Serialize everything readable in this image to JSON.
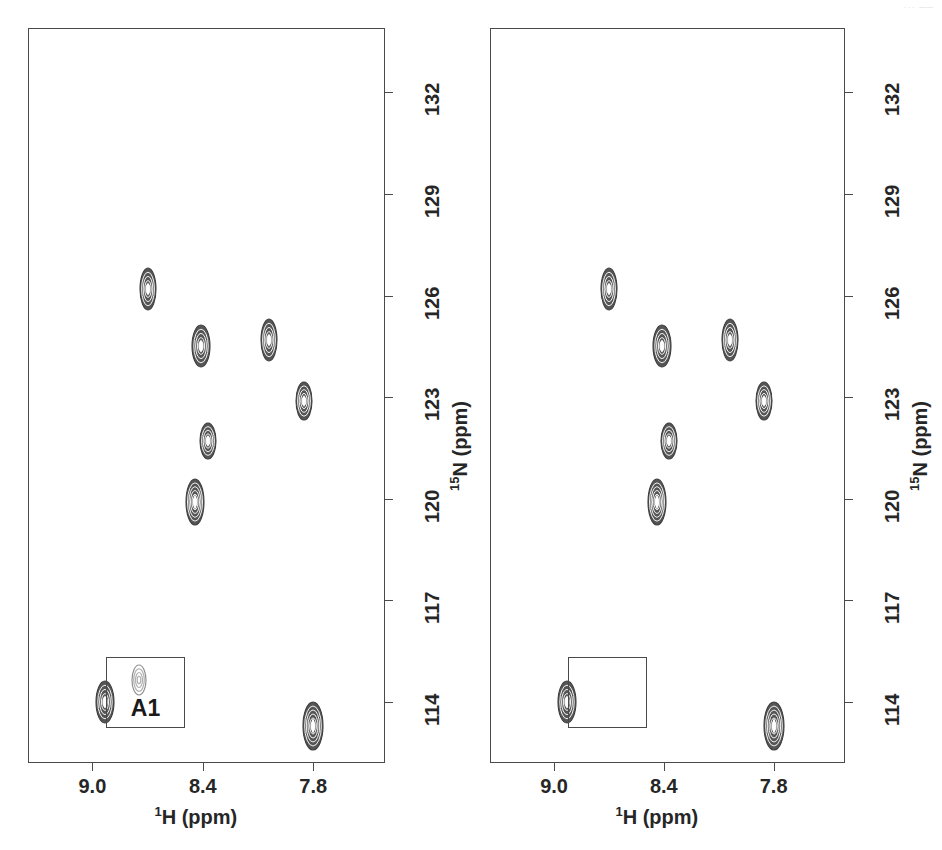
{
  "figure": {
    "width": 942,
    "height": 850,
    "background": "#ffffff",
    "ink_color": "#4a4a4a",
    "peak_color": "#555555",
    "artifact_text": "···  ──"
  },
  "chart_data": {
    "type": "scatter",
    "title": "",
    "subtitle": "",
    "xlabel": "1H (ppm)",
    "ylabel": "15N (ppm)",
    "xlabel_rich": {
      "superscript": "1",
      "base": "H (ppm)"
    },
    "ylabel_rich": {
      "superscript": "15",
      "base": "N (ppm)"
    },
    "xticks": [
      "9.0",
      "8.4",
      "7.8"
    ],
    "xtick_values": [
      9.0,
      8.4,
      7.8
    ],
    "yticks": [
      "114",
      "117",
      "120",
      "123",
      "126",
      "129",
      "132"
    ],
    "ytick_values": [
      114,
      117,
      120,
      123,
      126,
      129,
      132
    ],
    "xlim": [
      9.35,
      7.41
    ],
    "ylim": [
      133.9,
      112.2
    ],
    "x_axis_direction": "reversed",
    "y_axis_direction": "reversed",
    "y_axis_side": "right",
    "grid": false,
    "legend": false,
    "panels": [
      {
        "id": "left",
        "name": "panel-left",
        "frame": {
          "x": 28,
          "y": 28,
          "width": 357,
          "height": 735
        },
        "series": [
          {
            "name": "cross-peaks",
            "points": [
              {
                "label": "peak-1",
                "h": 8.93,
                "n": 114.0,
                "rx": 9,
                "ry": 21,
                "rings": 5
              },
              {
                "label": "peak-2",
                "h": 7.8,
                "n": 113.3,
                "rx": 10,
                "ry": 24,
                "rings": 6
              },
              {
                "label": "peak-3",
                "h": 8.44,
                "n": 119.9,
                "rx": 9,
                "ry": 23,
                "rings": 6
              },
              {
                "label": "peak-4",
                "h": 8.37,
                "n": 121.7,
                "rx": 8,
                "ry": 18,
                "rings": 5
              },
              {
                "label": "peak-5",
                "h": 7.85,
                "n": 122.9,
                "rx": 8,
                "ry": 19,
                "rings": 5
              },
              {
                "label": "peak-6",
                "h": 8.41,
                "n": 124.5,
                "rx": 9,
                "ry": 21,
                "rings": 5
              },
              {
                "label": "peak-7",
                "h": 8.04,
                "n": 124.7,
                "rx": 8,
                "ry": 21,
                "rings": 5
              },
              {
                "label": "peak-8",
                "h": 8.7,
                "n": 126.2,
                "rx": 8,
                "ry": 21,
                "rings": 5
              }
            ]
          }
        ],
        "inset": {
          "present": true,
          "box": {
            "x": 106,
            "y": 657,
            "width": 79,
            "height": 71
          },
          "label": "A1",
          "peak": {
            "cx": 139,
            "cy": 680,
            "rx": 7,
            "ry": 15,
            "rings": 4,
            "faint": true
          }
        }
      },
      {
        "id": "right",
        "name": "panel-right",
        "frame": {
          "x": 490,
          "y": 28,
          "width": 355,
          "height": 735
        },
        "series": [
          {
            "name": "cross-peaks",
            "points": [
              {
                "label": "peak-1",
                "h": 8.93,
                "n": 114.0,
                "rx": 9,
                "ry": 21,
                "rings": 5
              },
              {
                "label": "peak-2",
                "h": 7.8,
                "n": 113.3,
                "rx": 10,
                "ry": 24,
                "rings": 6
              },
              {
                "label": "peak-3",
                "h": 8.44,
                "n": 119.9,
                "rx": 9,
                "ry": 23,
                "rings": 6
              },
              {
                "label": "peak-4",
                "h": 8.37,
                "n": 121.7,
                "rx": 8,
                "ry": 18,
                "rings": 5
              },
              {
                "label": "peak-5",
                "h": 7.85,
                "n": 122.9,
                "rx": 8,
                "ry": 19,
                "rings": 5
              },
              {
                "label": "peak-6",
                "h": 8.41,
                "n": 124.5,
                "rx": 9,
                "ry": 21,
                "rings": 5
              },
              {
                "label": "peak-7",
                "h": 8.04,
                "n": 124.7,
                "rx": 8,
                "ry": 21,
                "rings": 5
              },
              {
                "label": "peak-8",
                "h": 8.7,
                "n": 126.2,
                "rx": 8,
                "ry": 21,
                "rings": 5
              }
            ]
          }
        ],
        "inset": {
          "present": true,
          "box": {
            "x": 568,
            "y": 657,
            "width": 79,
            "height": 71
          },
          "label": "",
          "peak": null
        }
      }
    ]
  }
}
